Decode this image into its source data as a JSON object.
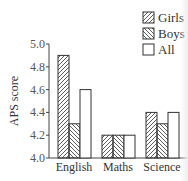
{
  "chart_data": {
    "type": "bar",
    "title": "",
    "xlabel": "",
    "ylabel": "APS score",
    "ylim": [
      4.0,
      5.0
    ],
    "yticks": [
      "4.0",
      "4.2",
      "4.4",
      "4.6",
      "4.8",
      "5.0"
    ],
    "categories": [
      "English",
      "Maths",
      "Science"
    ],
    "series": [
      {
        "name": "Girls",
        "values": [
          4.9,
          4.2,
          4.4
        ],
        "pattern": "hatch-forward"
      },
      {
        "name": "Boys",
        "values": [
          4.3,
          4.2,
          4.3
        ],
        "pattern": "hatch-backward"
      },
      {
        "name": "All",
        "values": [
          4.6,
          4.2,
          4.4
        ],
        "pattern": "none"
      }
    ],
    "legend": {
      "position": "top-right",
      "labels_visible": [
        "Girl",
        "Boy",
        "All"
      ]
    },
    "grid": false
  }
}
